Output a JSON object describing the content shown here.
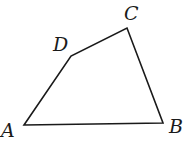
{
  "figure": {
    "type": "quadrilateral",
    "stroke_color": "#1a1a1a",
    "vertices": [
      {
        "name": "A",
        "x": 24,
        "y": 125,
        "label_x": 1,
        "label_y": 137
      },
      {
        "name": "B",
        "x": 163,
        "y": 123,
        "label_x": 169,
        "label_y": 133
      },
      {
        "name": "C",
        "x": 127,
        "y": 28,
        "label_x": 124,
        "label_y": 20
      },
      {
        "name": "D",
        "x": 71,
        "y": 56,
        "label_x": 53,
        "label_y": 51
      }
    ]
  },
  "labels": {
    "A": "A",
    "B": "B",
    "C": "C",
    "D": "D"
  }
}
